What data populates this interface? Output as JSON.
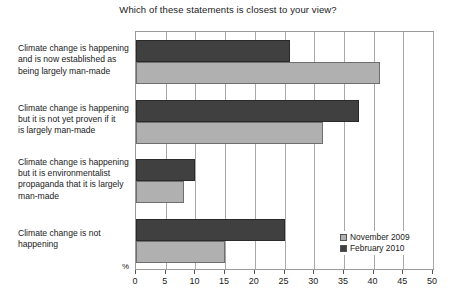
{
  "chart_data": {
    "type": "bar",
    "orientation": "horizontal",
    "title": "Which of these statements is closest to your view?",
    "xlabel": "%",
    "ylabel": "",
    "xlim": [
      0,
      50
    ],
    "xticks": [
      0,
      5,
      10,
      15,
      20,
      25,
      30,
      35,
      40,
      45,
      50
    ],
    "xtick_labels": [
      "0",
      "5",
      "10",
      "15",
      "20",
      "25",
      "30",
      "35",
      "40",
      "45",
      "50"
    ],
    "grid": true,
    "legend_position": "bottom-right",
    "categories": [
      "Climate change is happening and is now established as being largely man-made",
      "Climate change is happening but it is not yet proven if it is largely man-made",
      "Climate change is happening but it is environmentalist propaganda that it is largely man-made",
      "Climate change is not happening"
    ],
    "category_lines": [
      [
        "Climate change is happening",
        "and is now established as",
        "being largely man-made"
      ],
      [
        "Climate change is happening",
        "but it is not yet proven if it",
        "is largely man-made"
      ],
      [
        "Climate change is happening",
        "but it is environmentalist",
        "propaganda that it is largely",
        "man-made"
      ],
      [
        "Climate change is not",
        "happening"
      ]
    ],
    "series": [
      {
        "name": "November 2009",
        "color": "#b0b0b0",
        "values": [
          41,
          31.5,
          8,
          15
        ]
      },
      {
        "name": "February 2010",
        "color": "#404040",
        "values": [
          26,
          37.5,
          10,
          25
        ]
      }
    ]
  },
  "legend": {
    "items": [
      {
        "label": "November 2009"
      },
      {
        "label": "February 2010"
      }
    ]
  }
}
